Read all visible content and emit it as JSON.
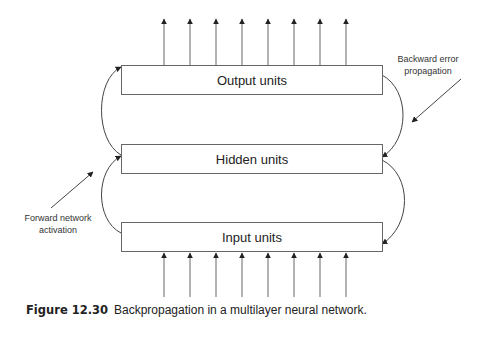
{
  "figure": {
    "boxes": {
      "output": "Output units",
      "hidden": "Hidden units",
      "input": "Input units"
    },
    "annotations": {
      "backward": [
        "Backward error",
        "propagation"
      ],
      "forward": [
        "Forward network",
        "activation"
      ]
    },
    "output_arrow_count": 8,
    "input_arrow_count": 8,
    "caption": {
      "number": "Figure 12.30",
      "text": "Backpropagation in a multilayer neural network."
    }
  }
}
